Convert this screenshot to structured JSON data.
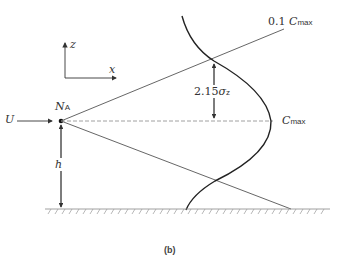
{
  "figure": {
    "caption": "(b)",
    "axes": {
      "z_label": "z",
      "x_label": "x"
    },
    "source": {
      "wind_label": "U",
      "point_label": "N",
      "point_subscript": "A"
    },
    "height_label": "h",
    "spread_label": "2.15",
    "spread_sigma": "σ",
    "spread_sigma_sub": "z",
    "upper_edge_label_prefix": "0.1",
    "cmax_label": "C",
    "cmax_sub": "max",
    "colors": {
      "line": "#444444",
      "curve": "#222222",
      "dashed": "#888888"
    }
  }
}
